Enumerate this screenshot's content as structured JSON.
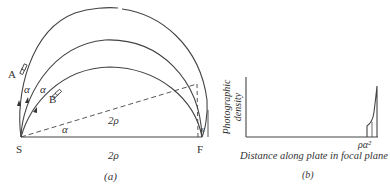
{
  "panel_a": {
    "caption": "(a)",
    "points": {
      "source": "S",
      "focus": "F"
    },
    "beam_labels": {
      "outer": "A",
      "inner": "B"
    },
    "angle_labels": [
      "α",
      "α",
      "α"
    ],
    "distance_labels": {
      "baseline": "2ρ",
      "chord": "2ρ"
    },
    "spread_label": "s"
  },
  "panel_b": {
    "caption": "(b)",
    "y_axis_label_line1": "Photographic",
    "y_axis_label_line2": "density",
    "x_axis_label": "Distance along plate in focal plane",
    "tick_label": "ρα²"
  },
  "colors": {
    "line": "#444444",
    "text": "#333333",
    "background": "#ffffff"
  }
}
